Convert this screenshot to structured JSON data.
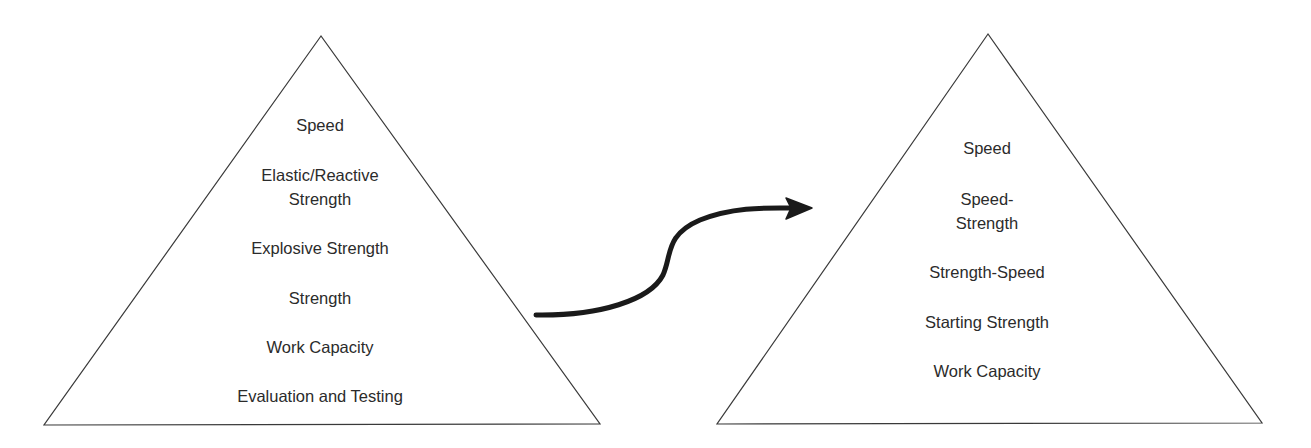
{
  "diagram": {
    "type": "pyramid-transition",
    "left_pyramid": {
      "levels_top_to_bottom": [
        "Speed",
        "Elastic/Reactive Strength",
        "Explosive Strength",
        "Strength",
        "Work Capacity",
        "Evaluation and Testing"
      ],
      "labels": {
        "speed": "Speed",
        "elastic_line1": "Elastic/Reactive",
        "elastic_line2": "Strength",
        "explosive": "Explosive Strength",
        "strength": "Strength",
        "work_capacity": "Work Capacity",
        "evaluation": "Evaluation and Testing"
      }
    },
    "right_pyramid": {
      "levels_top_to_bottom": [
        "Speed",
        "Speed-Strength",
        "Strength-Speed",
        "Starting Strength",
        "Work Capacity"
      ],
      "labels": {
        "speed": "Speed",
        "speed_strength_line1": "Speed-",
        "speed_strength_line2": "Strength",
        "strength_speed": "Strength-Speed",
        "starting_strength": "Starting Strength",
        "work_capacity": "Work Capacity"
      }
    },
    "connector": {
      "shape": "s-curve-arrow",
      "direction": "left-to-right"
    },
    "colors": {
      "stroke": "#3a3a3a",
      "arrow": "#1a1a1a",
      "text": "#2b2b2b",
      "background": "#ffffff"
    }
  }
}
